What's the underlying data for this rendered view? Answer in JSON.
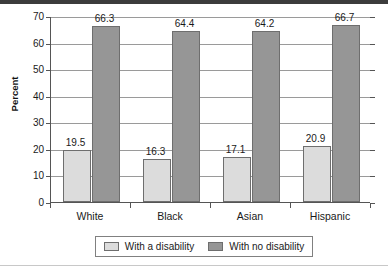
{
  "chart_data": {
    "type": "bar",
    "title": "",
    "xlabel": "",
    "ylabel": "Percent",
    "ylim": [
      0,
      70
    ],
    "ytick_labels": [
      "0",
      "10",
      "20",
      "30",
      "40",
      "50",
      "60",
      "70"
    ],
    "ytick_values": [
      0,
      10,
      20,
      30,
      40,
      50,
      60,
      70
    ],
    "grid": true,
    "legend_position": "bottom-center",
    "categories": [
      "White",
      "Black",
      "Asian",
      "Hispanic"
    ],
    "series": [
      {
        "name": "With a disability",
        "color": "#dcdcdc",
        "values": [
          19.5,
          16.3,
          17.1,
          20.9
        ],
        "value_labels": [
          "19.5",
          "16.3",
          "17.1",
          "20.9"
        ]
      },
      {
        "name": "With no disability",
        "color": "#969696",
        "values": [
          66.3,
          64.4,
          64.2,
          66.7
        ],
        "value_labels": [
          "66.3",
          "64.4",
          "64.2",
          "66.7"
        ]
      }
    ]
  },
  "legend": {
    "entries": [
      {
        "label": "With a disability"
      },
      {
        "label": "With no disability"
      }
    ]
  }
}
